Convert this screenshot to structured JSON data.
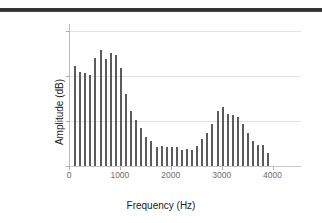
{
  "figure": {
    "top_rule_color": "#2f2f31",
    "bar_color": "#5b5b5b",
    "grid_color": "#e2e2e2",
    "axis_color": "#b9b9b9"
  },
  "chart_data": {
    "type": "bar",
    "title": "",
    "subtitle": "",
    "xlabel": "Frequency (Hz)",
    "ylabel": "Amplitude (dB)",
    "xlim": [
      0,
      4500
    ],
    "ylim": [
      0,
      62
    ],
    "xticks": [
      0,
      1000,
      2000,
      3000,
      4000
    ],
    "xtick_labels": [
      "0",
      "1000",
      "2000",
      "3000",
      "4000"
    ],
    "yticks": [
      0,
      20,
      40,
      60
    ],
    "ytick_labels": [
      "0",
      "20",
      "40",
      "60"
    ],
    "grid": "horizontal",
    "legend": "none",
    "annotations": [],
    "x": [
      100,
      200,
      300,
      400,
      500,
      600,
      700,
      800,
      900,
      1000,
      1100,
      1200,
      1300,
      1400,
      1500,
      1600,
      1700,
      1800,
      1900,
      2000,
      2100,
      2200,
      2300,
      2400,
      2500,
      2600,
      2700,
      2800,
      2900,
      3000,
      3100,
      3200,
      3300,
      3400,
      3500,
      3600,
      3700,
      3800,
      3900
    ],
    "values": [
      44.5,
      41.8,
      41.2,
      40.5,
      48.0,
      51.3,
      47.2,
      50.2,
      49.0,
      43.5,
      32.0,
      24.5,
      20.5,
      17.0,
      13.0,
      11.0,
      8.5,
      8.8,
      8.2,
      8.3,
      8.2,
      7.2,
      7.5,
      7.3,
      9.0,
      11.8,
      14.8,
      18.5,
      24.5,
      26.2,
      23.0,
      22.5,
      21.5,
      18.5,
      14.5,
      11.2,
      9.5,
      9.2,
      5.8
    ],
    "series": [
      {
        "name": "Spectrum",
        "values": [
          44.5,
          41.8,
          41.2,
          40.5,
          48.0,
          51.3,
          47.2,
          50.2,
          49.0,
          43.5,
          32.0,
          24.5,
          20.5,
          17.0,
          13.0,
          11.0,
          8.5,
          8.8,
          8.2,
          8.3,
          8.2,
          7.2,
          7.5,
          7.3,
          9.0,
          11.8,
          14.8,
          18.5,
          24.5,
          26.2,
          23.0,
          22.5,
          21.5,
          18.5,
          14.5,
          11.2,
          9.5,
          9.2,
          5.8
        ]
      }
    ]
  }
}
